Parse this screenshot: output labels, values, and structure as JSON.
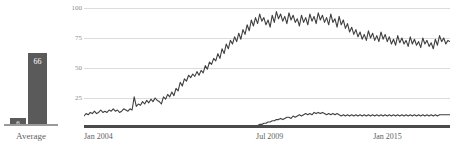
{
  "average_panel": {
    "axis_label": "Average",
    "bars": [
      {
        "name": "low",
        "label": "6",
        "value": 6
      },
      {
        "name": "high",
        "label": "66",
        "value": 66
      }
    ],
    "bar_color": "#5a5a5a",
    "value_text_color": "#ffffff",
    "baseline_color": "#9a9a9a",
    "scale_max": 80
  },
  "line_panel": {
    "axis_color": "#4a4a4a",
    "grid_color": "#dcdcdc",
    "tick_text_color": "#8d8d8d",
    "line_color": "#3f3f3f"
  },
  "chart_data": {
    "type": "line",
    "title": "",
    "xlabel": "",
    "ylabel": "",
    "ylim": [
      0,
      100
    ],
    "yticks": [
      100,
      75,
      50,
      25
    ],
    "ytick_labels": [
      "100",
      "75",
      "50",
      "25"
    ],
    "grid": true,
    "legend": "none",
    "xtick_labels": [
      "Jan 2004",
      "Jul 2009",
      "Jan 2015"
    ],
    "xtick_positions": [
      0,
      0.47,
      0.79
    ],
    "x_range": [
      "Jan 2004",
      "Dec 2018"
    ],
    "series": [
      {
        "name": "upper",
        "values": [
          10,
          12,
          11,
          13,
          12,
          14,
          12,
          13,
          15,
          13,
          14,
          13,
          15,
          14,
          16,
          14,
          15,
          13,
          14,
          16,
          15,
          14,
          16,
          15,
          26,
          18,
          20,
          19,
          22,
          20,
          23,
          21,
          24,
          22,
          25,
          23,
          22,
          20,
          26,
          24,
          28,
          26,
          30,
          27,
          33,
          31,
          38,
          35,
          41,
          39,
          44,
          42,
          45,
          43,
          47,
          44,
          48,
          46,
          52,
          49,
          55,
          53,
          58,
          56,
          62,
          58,
          66,
          62,
          70,
          66,
          73,
          70,
          76,
          72,
          79,
          74,
          82,
          78,
          86,
          81,
          90,
          85,
          92,
          87,
          95,
          89,
          92,
          86,
          90,
          84,
          94,
          88,
          97,
          91,
          95,
          89,
          93,
          87,
          96,
          90,
          94,
          88,
          91,
          85,
          94,
          88,
          92,
          86,
          95,
          89,
          93,
          87,
          96,
          90,
          94,
          88,
          92,
          86,
          95,
          88,
          91,
          84,
          93,
          86,
          90,
          83,
          87,
          80,
          84,
          78,
          82,
          76,
          80,
          74,
          78,
          73,
          81,
          75,
          79,
          73,
          77,
          72,
          80,
          74,
          78,
          72,
          76,
          70,
          74,
          69,
          77,
          71,
          75,
          70,
          73,
          68,
          76,
          70,
          74,
          69,
          72,
          67,
          75,
          70,
          73,
          68,
          71,
          66,
          74,
          69,
          77,
          72,
          75,
          70,
          73,
          72
        ]
      },
      {
        "name": "lower",
        "values": [
          0,
          0,
          0,
          0,
          0,
          0,
          0,
          0,
          0,
          0,
          0,
          0,
          0,
          0,
          0,
          0,
          0,
          0,
          0,
          0,
          0,
          0,
          0,
          0,
          0,
          0,
          0,
          0,
          0,
          0,
          0,
          0,
          0,
          0,
          0,
          0,
          0,
          0,
          0,
          0,
          0,
          0,
          0,
          0,
          0,
          0,
          0,
          0,
          0,
          0,
          0,
          0,
          0,
          0,
          0,
          0,
          0,
          0,
          0,
          0,
          0,
          0,
          0,
          0,
          0,
          0,
          0,
          0,
          0,
          0,
          0,
          0,
          0,
          0,
          0,
          0,
          0,
          0,
          1,
          1,
          1,
          2,
          2,
          2,
          3,
          3,
          4,
          4,
          5,
          5,
          6,
          6,
          7,
          7,
          8,
          7,
          8,
          9,
          9,
          8,
          10,
          9,
          10,
          11,
          10,
          11,
          12,
          11,
          12,
          11,
          13,
          12,
          13,
          12,
          13,
          12,
          11,
          12,
          11,
          12,
          11,
          12,
          11,
          10,
          11,
          10,
          11,
          10,
          11,
          10,
          11,
          10,
          11,
          10,
          11,
          10,
          11,
          10,
          11,
          10,
          11,
          10,
          11,
          10,
          11,
          10,
          11,
          10,
          11,
          10,
          11,
          10,
          11,
          10,
          11,
          10,
          11,
          10,
          11,
          10,
          11,
          10,
          11,
          10,
          11,
          10,
          11,
          10,
          11,
          10,
          11,
          11,
          11,
          11,
          11,
          11
        ]
      }
    ]
  }
}
